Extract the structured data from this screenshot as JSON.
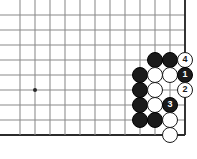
{
  "diagram": {
    "board": {
      "grid_spacing": 15,
      "origin_x": 20,
      "origin_y": 15,
      "cols": 11,
      "rows": 9,
      "line_color": "#8a8a8a",
      "edge_color": "#2b2b2b",
      "background": "#ffffff",
      "right_edge_col": 11,
      "bottom_edge_row": 8
    },
    "star_points": [
      {
        "col": 1,
        "row": 5
      }
    ],
    "stones": [
      {
        "color": "black",
        "col": 9,
        "row": 3,
        "label": ""
      },
      {
        "color": "black",
        "col": 10,
        "row": 3,
        "label": ""
      },
      {
        "color": "white",
        "col": 11,
        "row": 3,
        "label": "4"
      },
      {
        "color": "black",
        "col": 8,
        "row": 4,
        "label": ""
      },
      {
        "color": "white",
        "col": 9,
        "row": 4,
        "label": ""
      },
      {
        "color": "white",
        "col": 10,
        "row": 4,
        "label": ""
      },
      {
        "color": "black",
        "col": 11,
        "row": 4,
        "label": "1"
      },
      {
        "color": "black",
        "col": 8,
        "row": 5,
        "label": ""
      },
      {
        "color": "white",
        "col": 9,
        "row": 5,
        "label": ""
      },
      {
        "color": "white",
        "col": 11,
        "row": 5,
        "label": "2"
      },
      {
        "color": "black",
        "col": 8,
        "row": 6,
        "label": ""
      },
      {
        "color": "white",
        "col": 9,
        "row": 6,
        "label": ""
      },
      {
        "color": "black",
        "col": 10,
        "row": 6,
        "label": "3"
      },
      {
        "color": "black",
        "col": 8,
        "row": 7,
        "label": ""
      },
      {
        "color": "black",
        "col": 9,
        "row": 7,
        "label": ""
      },
      {
        "color": "white",
        "col": 10,
        "row": 7,
        "label": ""
      },
      {
        "color": "white",
        "col": 10,
        "row": 8,
        "label": ""
      }
    ],
    "stone_radius": 8.2
  }
}
